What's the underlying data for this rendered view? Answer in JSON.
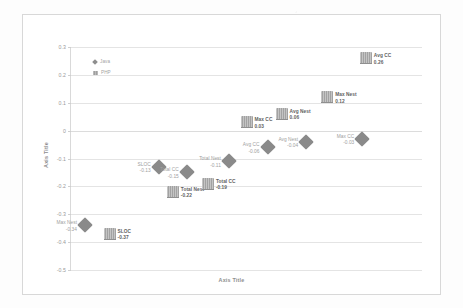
{
  "chart_data": {
    "type": "scatter",
    "title": "",
    "xlabel": "Axis Title",
    "ylabel": "Axis Title",
    "ylim": [
      -0.5,
      0.3
    ],
    "yticks": [
      "0.3",
      "0.2",
      "0.1",
      "0",
      "-0.1",
      "-0.2",
      "-0.3",
      "-0.4",
      "-0.5"
    ],
    "ytick_values": [
      0.3,
      0.2,
      0.1,
      0,
      -0.1,
      -0.2,
      -0.3,
      -0.4,
      -0.5
    ],
    "grid": true,
    "xticks": [],
    "legend_position": "top-left",
    "legend": [
      {
        "name": "Java",
        "marker": "diamond"
      },
      {
        "name": "PHP",
        "marker": "bar"
      }
    ],
    "series": [
      {
        "name": "Java",
        "marker": "diamond",
        "points": [
          {
            "label": "SLOC",
            "value": "-0.13",
            "y": -0.13,
            "x": 1,
            "label_side": "left"
          },
          {
            "label": "Max Nest",
            "value": "-0.34",
            "y": -0.34,
            "x": 0,
            "label_side": "left"
          },
          {
            "label": "Total CC",
            "value": "-0.15",
            "y": -0.15,
            "x": 2,
            "label_side": "left"
          },
          {
            "label": "Total Nest",
            "value": "-0.11",
            "y": -0.11,
            "x": 3,
            "label_side": "left"
          },
          {
            "label": "Avg CC",
            "value": "-0.06",
            "y": -0.06,
            "x": 4,
            "label_side": "left"
          },
          {
            "label": "Avg Nest",
            "value": "-0.04",
            "y": -0.04,
            "x": 5,
            "label_side": "left"
          },
          {
            "label": "Max CC",
            "value": "-0.03",
            "y": -0.03,
            "x": 6,
            "label_side": "left"
          }
        ]
      },
      {
        "name": "PHP",
        "marker": "bar",
        "points": [
          {
            "label": "SLOC",
            "value": "-0.37",
            "y": -0.37,
            "x": 0,
            "label_side": "right"
          },
          {
            "label": "Total Nest",
            "value": "-0.22",
            "y": -0.22,
            "x": 1,
            "label_side": "right"
          },
          {
            "label": "Total CC",
            "value": "-0.19",
            "y": -0.19,
            "x": 2,
            "label_side": "right"
          },
          {
            "label": "Max CC",
            "value": "0.03",
            "y": 0.03,
            "x": 3,
            "label_side": "right"
          },
          {
            "label": "Avg Nest",
            "value": "0.06",
            "y": 0.06,
            "x": 4,
            "label_side": "right"
          },
          {
            "label": "Max Nest",
            "value": "0.12",
            "y": 0.12,
            "x": 5,
            "label_side": "right"
          },
          {
            "label": "Avg CC",
            "value": "0.26",
            "y": 0.26,
            "x": 6,
            "label_side": "right"
          }
        ]
      }
    ]
  },
  "colors": {
    "diamond": "#8a8a8a",
    "bar": "#aaaaaa",
    "grid": "#e4e4e4",
    "axis_text": "#9a9a9a",
    "label_text": "#5f5f5f",
    "frame": "#d8d8d8"
  }
}
